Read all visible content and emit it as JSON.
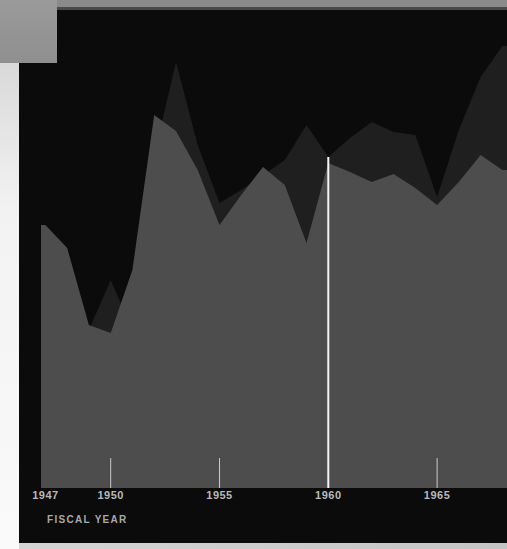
{
  "chart_data": {
    "type": "area",
    "title": "",
    "xlabel": "FISCAL YEAR",
    "ylabel": "",
    "x": [
      1947,
      1948,
      1949,
      1950,
      1951,
      1952,
      1953,
      1954,
      1955,
      1956,
      1957,
      1958,
      1959,
      1960,
      1961,
      1962,
      1963,
      1964,
      1965,
      1966,
      1967,
      1968
    ],
    "series": [
      {
        "name": "back-dark-area",
        "color": "#201f1f",
        "heights_px": [
          243,
          218,
          158,
          208,
          158,
          333,
          426,
          343,
          285,
          298,
          313,
          328,
          363,
          331,
          350,
          366,
          356,
          353,
          291,
          358,
          411,
          442
        ]
      },
      {
        "name": "front-gray-area",
        "color": "#4d4d4d",
        "heights_px": [
          263,
          240,
          163,
          155,
          218,
          373,
          357,
          318,
          263,
          293,
          321,
          303,
          245,
          325,
          316,
          306,
          314,
          300,
          283,
          306,
          333,
          318
        ]
      }
    ],
    "x_tick_labels": [
      "1947",
      "1950",
      "1955",
      "1960",
      "1965"
    ],
    "x_tick_label_years": [
      1947,
      1950,
      1955,
      1960,
      1965
    ],
    "x_tick_mark_years": [
      1950,
      1955,
      1965
    ],
    "reference_line_year": 1960,
    "legend": "none",
    "grid": "off",
    "ylim_px": [
      0,
      478
    ],
    "note": "No y-axis scale, title or legend visible; series values are estimated pixel heights above the x-axis baseline."
  },
  "axis": {
    "fiscal_year_label": "FISCAL YEAR"
  },
  "colors": {
    "background": "#0a0a0a",
    "panel": "#0b0b0b",
    "dark_area": "#201f1f",
    "gray_area": "#4d4d4d",
    "top_band": "#8a8a8a",
    "band_edge": "#4a4a4a",
    "corner_block": "#8f8f8f",
    "left_strip": "#f2f2f2",
    "bottom_strip": "#c4c4c4",
    "tick": "#c9c9c9",
    "reference_line": "#f5f5f5",
    "label": "#b9b9b9",
    "axis_title": "#a8a8a8"
  }
}
